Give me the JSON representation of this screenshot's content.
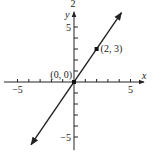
{
  "chart_data": {
    "type": "line",
    "title": "2",
    "xlabel": "x",
    "ylabel": "y",
    "xlim": [
      -6.2,
      6.2
    ],
    "ylim": [
      -6.2,
      6.2
    ],
    "x_ticks": [
      -5,
      -4,
      -3,
      -2,
      -1,
      1,
      2,
      3,
      4,
      5
    ],
    "y_ticks": [
      -5,
      -4,
      -3,
      -2,
      -1,
      1,
      2,
      3,
      4,
      5
    ],
    "x_tick_labels": [
      {
        "value": -5,
        "label": "−5"
      },
      {
        "value": 5,
        "label": "5"
      }
    ],
    "y_tick_labels": [
      {
        "value": 5,
        "label": "5"
      },
      {
        "value": -5,
        "label": "−5"
      }
    ],
    "series": [
      {
        "name": "y = 1.5x",
        "slope": 1.5,
        "intercept": 0,
        "x_range": [
          -3.8,
          4.2
        ],
        "arrows": "both"
      }
    ],
    "points": [
      {
        "x": 0,
        "y": 0,
        "label": "(0, 0)"
      },
      {
        "x": 2,
        "y": 3,
        "label": "(2, 3)"
      }
    ],
    "grid": false,
    "legend": "none"
  }
}
